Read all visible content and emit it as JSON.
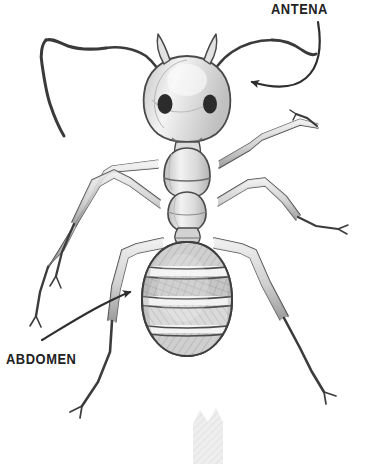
{
  "figure": {
    "subject": "ant",
    "style": "pencil sketch",
    "background_color": "#ffffff",
    "ink_color": "#3a3a3a",
    "shade_light": "#e8e8e8",
    "shade_mid": "#c9c9c9",
    "shade_dark": "#9a9a9a",
    "eye_color": "#2b2b2b",
    "width": 375,
    "height": 464
  },
  "labels": [
    {
      "id": "antena",
      "text": "ANTENA",
      "x": 271,
      "y": 1,
      "arrow": {
        "name": "antena-arrow",
        "direction": "left",
        "points_to": "antenna"
      }
    },
    {
      "id": "abdomen",
      "text": "ABDOMEN",
      "x": 6,
      "y": 351,
      "arrow": {
        "name": "abdomen-arrow",
        "direction": "right",
        "points_to": "abdomen"
      }
    }
  ],
  "body_parts": {
    "head": "head",
    "eye_left": "left-eye",
    "eye_right": "right-eye",
    "mandible_left": "left-mandible",
    "mandible_right": "right-mandible",
    "antenna_left": "left-antenna",
    "antenna_right": "right-antenna",
    "thorax": "thorax",
    "petiole": "petiole",
    "abdomen": "abdomen",
    "legs": [
      "front-left-leg",
      "front-right-leg",
      "middle-left-leg",
      "middle-right-leg",
      "hind-left-leg",
      "hind-right-leg"
    ]
  },
  "bottom_artifact": {
    "name": "bottom-partial-shape",
    "description": "partially visible shaded shape with zigzag top edge at bottom center"
  }
}
